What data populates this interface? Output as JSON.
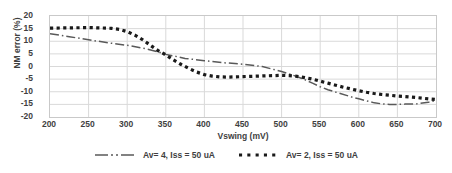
{
  "chart_data": {
    "type": "line",
    "title": "",
    "xlabel": "Vswing (mV)",
    "ylabel": "NM error (%)",
    "xlim": [
      200,
      700
    ],
    "ylim": [
      -20,
      20
    ],
    "xticks": [
      200,
      250,
      300,
      350,
      400,
      450,
      500,
      550,
      600,
      650,
      700
    ],
    "yticks": [
      20,
      15,
      10,
      5,
      0,
      -5,
      -10,
      -15,
      -20
    ],
    "grid": true,
    "legend_position": "bottom",
    "series": [
      {
        "name": "Av= 4, Iss = 50 uA",
        "style": "dash-dot",
        "color": "#595959",
        "x": [
          200,
          225,
          250,
          275,
          300,
          325,
          340,
          350,
          360,
          375,
          400,
          425,
          450,
          475,
          490,
          500,
          510,
          520,
          530,
          540,
          550,
          560,
          575,
          590,
          600,
          610,
          620,
          630,
          640,
          650,
          660,
          675,
          690,
          700
        ],
        "y": [
          13.0,
          11.8,
          10.6,
          9.4,
          8.4,
          7.0,
          5.8,
          4.8,
          4.2,
          3.2,
          2.3,
          1.5,
          0.9,
          0.0,
          -1.2,
          -2.0,
          -3.0,
          -4.0,
          -5.2,
          -6.6,
          -8.0,
          -9.2,
          -10.6,
          -12.0,
          -12.8,
          -13.6,
          -14.4,
          -14.8,
          -15.0,
          -15.0,
          -14.9,
          -14.8,
          -14.2,
          -13.4
        ]
      },
      {
        "name": "Av= 2, Iss = 50 uA",
        "style": "dotted",
        "color": "#1a1a1a",
        "x": [
          200,
          225,
          250,
          265,
          280,
          290,
          300,
          310,
          320,
          330,
          340,
          350,
          360,
          370,
          380,
          390,
          400,
          410,
          420,
          430,
          440,
          450,
          460,
          470,
          480,
          490,
          500,
          510,
          520,
          530,
          540,
          550,
          560,
          570,
          580,
          590,
          600,
          610,
          620,
          630,
          640,
          650,
          660,
          675,
          690,
          700
        ],
        "y": [
          15.2,
          15.3,
          15.4,
          15.3,
          15.1,
          14.7,
          13.8,
          12.4,
          10.6,
          8.4,
          6.3,
          4.6,
          2.6,
          0.8,
          -0.8,
          -2.2,
          -3.2,
          -3.8,
          -4.1,
          -4.2,
          -4.1,
          -4.0,
          -3.9,
          -3.8,
          -3.7,
          -3.6,
          -3.5,
          -3.6,
          -3.9,
          -4.4,
          -5.0,
          -5.8,
          -6.6,
          -7.4,
          -8.2,
          -8.9,
          -9.6,
          -10.2,
          -10.7,
          -11.1,
          -11.4,
          -11.7,
          -11.9,
          -12.3,
          -12.8,
          -13.1
        ]
      }
    ]
  },
  "axes": {
    "y_tick_labels": [
      "20",
      "15",
      "10",
      "5",
      "0",
      "-5",
      "-10",
      "-15",
      "-20"
    ],
    "x_tick_labels": [
      "200",
      "250",
      "300",
      "350",
      "400",
      "450",
      "500",
      "550",
      "600",
      "650",
      "700"
    ],
    "x_title": "Vswing (mV)",
    "y_title": "NM error (%)"
  },
  "legend": {
    "entries": [
      {
        "label": "Av= 4, Iss = 50 uA",
        "style": "dash-dot"
      },
      {
        "label": "Av= 2, Iss = 50 uA",
        "style": "dotted"
      }
    ]
  },
  "colors": {
    "series_1": "#595959",
    "series_2": "#1a1a1a",
    "grid": "#d9d9d9",
    "axis": "#c9c9c9",
    "text": "#3f3f3f",
    "background": "#ffffff"
  }
}
